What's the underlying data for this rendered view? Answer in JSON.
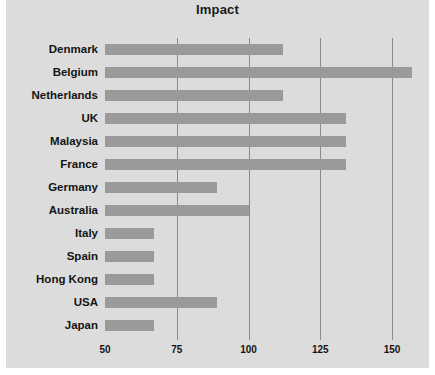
{
  "chart_data": {
    "type": "bar",
    "orientation": "horizontal",
    "title": "Impact",
    "xlabel": "",
    "ylabel": "",
    "xlim": [
      50,
      158
    ],
    "xticks": [
      50,
      75,
      100,
      125,
      150
    ],
    "xtick_labels": [
      "50",
      "75",
      "100",
      "125",
      "150"
    ],
    "grid": true,
    "legend": false,
    "categories": [
      "Denmark",
      "Belgium",
      "Netherlands",
      "UK",
      "Malaysia",
      "France",
      "Germany",
      "Australia",
      "Italy",
      "Spain",
      "Hong Kong",
      "USA",
      "Japan"
    ],
    "values": [
      112,
      157,
      112,
      134,
      134,
      134,
      89,
      100,
      67,
      67,
      67,
      89,
      67
    ],
    "bar_color": "#9a9a9a",
    "panel_color": "#dcdcdc",
    "grid_color": "#8a8a8a",
    "text_color": "#141414"
  }
}
